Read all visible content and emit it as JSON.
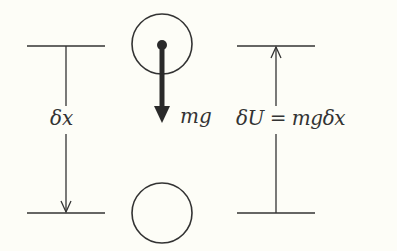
{
  "diagram": {
    "left_label": "δx",
    "force_label": "mg",
    "right_label": "δU = mgδx",
    "colors": {
      "background": "#fdfdf7",
      "stroke": "#333333",
      "arrow": "#2a2a2a"
    }
  }
}
